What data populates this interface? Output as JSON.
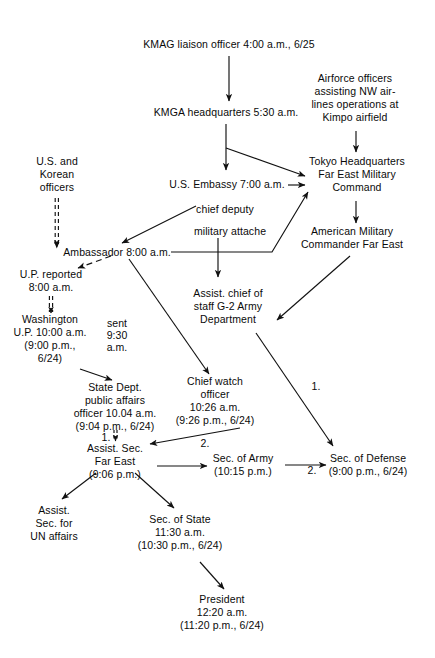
{
  "diagram": {
    "type": "flowchart",
    "stroke_color": "#111111",
    "background": "#ffffff",
    "nodes": [
      {
        "id": "kmag_liaison",
        "text": "KMAG liaison officer 4:00 a.m., 6/25",
        "x": 229,
        "y": 45,
        "align": "center"
      },
      {
        "id": "kmga_hq",
        "text": "KMGA headquarters 5:30 a.m.",
        "x": 226,
        "y": 113,
        "align": "center"
      },
      {
        "id": "airforce",
        "text": "Airforce officers\nassisting NW air-\nlines operations at\nKimpo airfield",
        "x": 355,
        "y": 79,
        "align": "center"
      },
      {
        "id": "tokyo_hq",
        "text": "Tokyo Headquarters\nFar East Military\nCommand",
        "x": 357,
        "y": 168,
        "align": "center"
      },
      {
        "id": "us_embassy",
        "text": "U.S. Embassy 7:00 a.m.",
        "x": 227,
        "y": 182,
        "align": "center"
      },
      {
        "id": "us_korean",
        "text": "U.S. and\nKorean\nofficers",
        "x": 57,
        "y": 161,
        "align": "center"
      },
      {
        "id": "chief_deputy",
        "text": "chief deputy",
        "x": 225,
        "y": 209,
        "align": "center"
      },
      {
        "id": "mil_attache",
        "text": "military attache",
        "x": 230,
        "y": 231,
        "align": "center"
      },
      {
        "id": "am_commander",
        "text": "American Military\nCommander Far East",
        "x": 352,
        "y": 235,
        "align": "center"
      },
      {
        "id": "ambassador",
        "text": "Ambassador 8:00 a.m.",
        "x": 117,
        "y": 251,
        "align": "center"
      },
      {
        "id": "up_reported",
        "text": "U.P. reported\n8:00 a.m.",
        "x": 51,
        "y": 278,
        "align": "center"
      },
      {
        "id": "g2_army",
        "text": "Assist. chief of\nstaff G-2 Army\nDepartment",
        "x": 228,
        "y": 294,
        "align": "center"
      },
      {
        "id": "washington",
        "text": "Washington\nU.P. 10:00 a.m.\n(9:00 p.m.,\n6/24)",
        "x": 50,
        "y": 332,
        "align": "center"
      },
      {
        "id": "state_dept",
        "text": "State Dept.\npublic affairs\nofficer 10.04 a.m.\n(9:04 p.m., 6/24)",
        "x": 115,
        "y": 391,
        "align": "center"
      },
      {
        "id": "chief_watch",
        "text": "Chief watch\nofficer\n10:26 a.m.\n(9:26 p.m., 6/24)",
        "x": 215,
        "y": 388,
        "align": "center"
      },
      {
        "id": "sec_defense",
        "text": "Sec. of Defense\n(9:00 p.m., 6/24)",
        "x": 368,
        "y": 459,
        "align": "center"
      },
      {
        "id": "assist_sec_fe",
        "text": "Assist. Sec.\nFar East\n(9:06 p.m.)",
        "x": 115,
        "y": 449,
        "align": "center"
      },
      {
        "id": "sec_army",
        "text": "Sec. of Army\n(10:15 p.m.)",
        "x": 243,
        "y": 459,
        "align": "center"
      },
      {
        "id": "assist_sec_un",
        "text": "Assist.\nSec. for\nUN affairs",
        "x": 54,
        "y": 511,
        "align": "center"
      },
      {
        "id": "sec_state",
        "text": "Sec. of State\n11:30 a.m.\n(10:30 p.m., 6/24)",
        "x": 180,
        "y": 520,
        "align": "center"
      },
      {
        "id": "president",
        "text": "President\n12:20 a.m.\n(11:20 p.m., 6/24)",
        "x": 222,
        "y": 600,
        "align": "center"
      }
    ],
    "edge_labels": [
      {
        "id": "lbl_sent",
        "text": "sent\n9:30\na.m.",
        "x": 117,
        "y": 324
      },
      {
        "id": "lbl_one_a",
        "text": "1.",
        "x": 316,
        "y": 386
      },
      {
        "id": "lbl_one_b",
        "text": "1.",
        "x": 106,
        "y": 437
      },
      {
        "id": "lbl_two_a",
        "text": "2.",
        "x": 205,
        "y": 443
      },
      {
        "id": "lbl_two_b",
        "text": "2.",
        "x": 312,
        "y": 470
      }
    ],
    "edges": [
      {
        "id": "e_kmag_to_kmga",
        "from": "kmag_liaison",
        "to": "kmga_hq",
        "style": "solid"
      },
      {
        "id": "e_kmga_to_embassy",
        "from": "kmga_hq",
        "to": "us_embassy",
        "style": "solid"
      },
      {
        "id": "e_kmga_to_tokyo",
        "from": "kmga_hq",
        "to": "tokyo_hq",
        "style": "solid"
      },
      {
        "id": "e_airforce_to_tokyo",
        "from": "airforce",
        "to": "tokyo_hq",
        "style": "solid"
      },
      {
        "id": "e_embassy_to_tokyo",
        "from": "us_embassy",
        "to": "tokyo_hq",
        "style": "solid"
      },
      {
        "id": "e_tokyo_to_commander",
        "from": "tokyo_hq",
        "to": "am_commander",
        "style": "solid"
      },
      {
        "id": "e_usk_to_ambassador",
        "from": "us_korean",
        "to": "ambassador",
        "style": "double"
      },
      {
        "id": "e_deputy_to_ambassador",
        "from": "chief_deputy",
        "to": "ambassador",
        "style": "solid"
      },
      {
        "id": "e_ambassador_to_up",
        "from": "ambassador",
        "to": "up_reported",
        "style": "dashed"
      },
      {
        "id": "e_attache_to_g2",
        "from": "mil_attache",
        "to": "g2_army",
        "style": "solid"
      },
      {
        "id": "e_ambassador_to_tokyo",
        "from": "ambassador",
        "to": "tokyo_hq",
        "style": "solid"
      },
      {
        "id": "e_up_to_washington",
        "from": "up_reported",
        "to": "washington",
        "style": "double"
      },
      {
        "id": "e_ambassador_to_watch",
        "from": "ambassador",
        "to": "chief_watch",
        "style": "solid",
        "label": "sent 9:30 a.m."
      },
      {
        "id": "e_washington_to_state",
        "from": "washington",
        "to": "state_dept",
        "style": "solid"
      },
      {
        "id": "e_commander_to_g2",
        "from": "am_commander",
        "to": "g2_army",
        "style": "solid"
      },
      {
        "id": "e_g2_to_defense",
        "from": "g2_army",
        "to": "sec_defense",
        "style": "solid",
        "label": "1."
      },
      {
        "id": "e_state_to_assist",
        "from": "state_dept",
        "to": "assist_sec_fe",
        "style": "double",
        "label": "1."
      },
      {
        "id": "e_watch_to_assist",
        "from": "chief_watch",
        "to": "assist_sec_fe",
        "style": "solid",
        "label": "2."
      },
      {
        "id": "e_assist_to_army",
        "from": "assist_sec_fe",
        "to": "sec_army",
        "style": "solid"
      },
      {
        "id": "e_army_to_defense",
        "from": "sec_army",
        "to": "sec_defense",
        "style": "solid",
        "label": "2."
      },
      {
        "id": "e_assist_to_un",
        "from": "assist_sec_fe",
        "to": "assist_sec_un",
        "style": "solid"
      },
      {
        "id": "e_assist_to_state",
        "from": "assist_sec_fe",
        "to": "sec_state",
        "style": "solid"
      },
      {
        "id": "e_state_to_president",
        "from": "sec_state",
        "to": "president",
        "style": "solid"
      }
    ]
  }
}
